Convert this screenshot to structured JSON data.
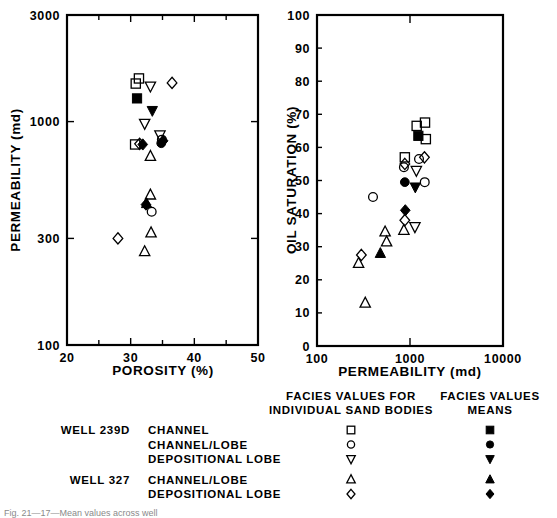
{
  "figure": {
    "caption_partial": "Fig. 21—17—Mean values across well",
    "panels": [
      "left",
      "right"
    ]
  },
  "left_plot": {
    "ylabel": "PERMEABILITY (md)",
    "xlabel": "POROSITY (%)",
    "y_ticklabels": [
      "3000",
      "1000",
      "300",
      "100"
    ],
    "x_ticklabels": [
      "20",
      "30",
      "40",
      "50"
    ]
  },
  "right_plot": {
    "ylabel": "OIL SATURATION (%)",
    "xlabel": "PERMEABILITY (md)",
    "y_ticklabels": [
      "100",
      "90",
      "80",
      "70",
      "60",
      "50",
      "40",
      "30",
      "20",
      "10",
      "0"
    ],
    "x_ticklabels": [
      "100",
      "1000",
      "10000"
    ]
  },
  "legend": {
    "header_individual_line1": "FACIES VALUES FOR",
    "header_individual_line2": "INDIVIDUAL SAND BODIES",
    "header_means_line1": "FACIES VALUES",
    "header_means_line2": "MEANS",
    "wells": [
      {
        "well_label": "WELL 239D",
        "facies": "CHANNEL",
        "open_symbol": "square",
        "filled_symbol": "square"
      },
      {
        "well_label": "",
        "facies": "CHANNEL/LOBE",
        "open_symbol": "circle",
        "filled_symbol": "circle"
      },
      {
        "well_label": "",
        "facies": "DEPOSITIONAL LOBE",
        "open_symbol": "triangle-down",
        "filled_symbol": "triangle-down"
      },
      {
        "well_label": "WELL 327",
        "facies": "CHANNEL/LOBE",
        "open_symbol": "triangle-up",
        "filled_symbol": "triangle-up"
      },
      {
        "well_label": "",
        "facies": "DEPOSITIONAL LOBE",
        "open_symbol": "diamond",
        "filled_symbol": "diamond"
      }
    ]
  },
  "chart_data": [
    {
      "id": "left",
      "type": "scatter",
      "title": "",
      "xlabel": "POROSITY (%)",
      "ylabel": "PERMEABILITY (md)",
      "xscale": "linear",
      "yscale": "log",
      "xlim": [
        20,
        50
      ],
      "ylim": [
        100,
        3000
      ],
      "xticks": [
        20,
        30,
        40,
        50
      ],
      "xminorticks": [
        25,
        35,
        45
      ],
      "yticks": [
        100,
        300,
        1000,
        3000
      ],
      "grid": false,
      "legend_position": "below-figure",
      "series": [
        {
          "name": "WELL 239D CHANNEL",
          "symbol": "square",
          "fill": "open",
          "points": [
            {
              "x": 30.8,
              "y": 1480
            },
            {
              "x": 31.3,
              "y": 1560
            },
            {
              "x": 30.7,
              "y": 790
            }
          ]
        },
        {
          "name": "WELL 239D CHANNEL mean",
          "symbol": "square",
          "fill": "filled",
          "points": [
            {
              "x": 31.0,
              "y": 1270
            }
          ]
        },
        {
          "name": "WELL 239D CHANNEL/LOBE",
          "symbol": "circle",
          "fill": "open",
          "points": [
            {
              "x": 34.9,
              "y": 830
            },
            {
              "x": 33.3,
              "y": 395
            }
          ]
        },
        {
          "name": "WELL 239D CHANNEL/LOBE mean",
          "symbol": "circle",
          "fill": "filled",
          "points": [
            {
              "x": 34.8,
              "y": 800
            }
          ]
        },
        {
          "name": "WELL 239D DEPOSITIONAL LOBE",
          "symbol": "triangle-down",
          "fill": "open",
          "points": [
            {
              "x": 33.1,
              "y": 1440
            },
            {
              "x": 32.2,
              "y": 980
            },
            {
              "x": 34.6,
              "y": 870
            }
          ]
        },
        {
          "name": "WELL 239D DEPOSITIONAL LOBE mean",
          "symbol": "triangle-down",
          "fill": "filled",
          "points": [
            {
              "x": 33.4,
              "y": 1120
            }
          ]
        },
        {
          "name": "WELL 327 CHANNEL/LOBE",
          "symbol": "triangle-up",
          "fill": "open",
          "points": [
            {
              "x": 33.1,
              "y": 700
            },
            {
              "x": 33.1,
              "y": 470
            },
            {
              "x": 33.2,
              "y": 318
            },
            {
              "x": 32.2,
              "y": 262
            }
          ]
        },
        {
          "name": "WELL 327 CHANNEL/LOBE mean",
          "symbol": "triangle-up",
          "fill": "filled",
          "points": [
            {
              "x": 32.5,
              "y": 430
            }
          ]
        },
        {
          "name": "WELL 327 DEPOSITIONAL LOBE",
          "symbol": "diamond",
          "fill": "open",
          "points": [
            {
              "x": 36.5,
              "y": 1490
            },
            {
              "x": 31.4,
              "y": 795
            },
            {
              "x": 28.0,
              "y": 300
            }
          ]
        },
        {
          "name": "WELL 327 DEPOSITIONAL LOBE mean",
          "symbol": "diamond",
          "fill": "filled",
          "points": [
            {
              "x": 31.9,
              "y": 790
            },
            {
              "x": 35.1,
              "y": 820
            },
            {
              "x": 32.4,
              "y": 425
            }
          ]
        }
      ]
    },
    {
      "id": "right",
      "type": "scatter",
      "title": "",
      "xlabel": "PERMEABILITY (md)",
      "ylabel": "OIL SATURATION (%)",
      "xscale": "log",
      "yscale": "linear",
      "xlim": [
        100,
        10000
      ],
      "ylim": [
        0,
        100
      ],
      "xticks": [
        100,
        1000,
        10000
      ],
      "yticks": [
        0,
        10,
        20,
        30,
        40,
        50,
        60,
        70,
        80,
        90,
        100
      ],
      "grid": false,
      "legend_position": "below-figure",
      "series": [
        {
          "name": "WELL 239D CHANNEL",
          "symbol": "square",
          "fill": "open",
          "points": [
            {
              "x": 1180,
              "y": 66.5
            },
            {
              "x": 1450,
              "y": 67.5
            },
            {
              "x": 1480,
              "y": 62.5
            },
            {
              "x": 880,
              "y": 57.0
            }
          ]
        },
        {
          "name": "WELL 239D CHANNEL mean",
          "symbol": "square",
          "fill": "filled",
          "points": [
            {
              "x": 1230,
              "y": 63.5
            }
          ]
        },
        {
          "name": "WELL 239D CHANNEL/LOBE",
          "symbol": "circle",
          "fill": "open",
          "points": [
            {
              "x": 860,
              "y": 54.0
            },
            {
              "x": 1250,
              "y": 56.5
            },
            {
              "x": 1440,
              "y": 49.5
            },
            {
              "x": 400,
              "y": 45.0
            }
          ]
        },
        {
          "name": "WELL 239D CHANNEL/LOBE mean",
          "symbol": "circle",
          "fill": "filled",
          "points": [
            {
              "x": 880,
              "y": 49.5
            }
          ]
        },
        {
          "name": "WELL 239D DEPOSITIONAL LOBE",
          "symbol": "triangle-down",
          "fill": "open",
          "points": [
            {
              "x": 1170,
              "y": 53.0
            },
            {
              "x": 1130,
              "y": 36.0
            }
          ]
        },
        {
          "name": "WELL 239D DEPOSITIONAL LOBE mean",
          "symbol": "triangle-down",
          "fill": "filled",
          "points": [
            {
              "x": 1140,
              "y": 48.0
            }
          ]
        },
        {
          "name": "WELL 327 CHANNEL/LOBE",
          "symbol": "triangle-up",
          "fill": "open",
          "points": [
            {
              "x": 540,
              "y": 34.5
            },
            {
              "x": 560,
              "y": 31.5
            },
            {
              "x": 860,
              "y": 35.0
            },
            {
              "x": 280,
              "y": 25.0
            },
            {
              "x": 330,
              "y": 13.0
            }
          ]
        },
        {
          "name": "WELL 327 CHANNEL/LOBE mean",
          "symbol": "triangle-up",
          "fill": "filled",
          "points": [
            {
              "x": 480,
              "y": 28.0
            }
          ]
        },
        {
          "name": "WELL 327 DEPOSITIONAL LOBE",
          "symbol": "diamond",
          "fill": "open",
          "points": [
            {
              "x": 1430,
              "y": 57.0
            },
            {
              "x": 880,
              "y": 55.0
            },
            {
              "x": 880,
              "y": 38.0
            },
            {
              "x": 300,
              "y": 27.5
            }
          ]
        },
        {
          "name": "WELL 327 DEPOSITIONAL LOBE mean",
          "symbol": "diamond",
          "fill": "filled",
          "points": [
            {
              "x": 890,
              "y": 41.0
            }
          ]
        }
      ]
    }
  ]
}
